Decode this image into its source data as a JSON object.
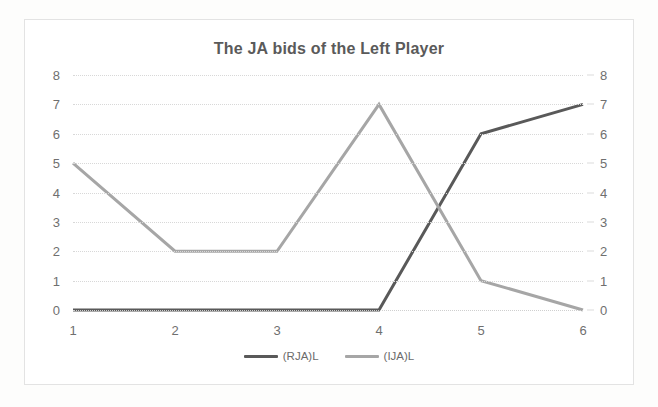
{
  "chart": {
    "title": "The JA bids of the Left Player"
  },
  "axes": {
    "left_ticks": [
      "8",
      "7",
      "6",
      "5",
      "4",
      "3",
      "2",
      "1",
      "0"
    ],
    "right_ticks": [
      "8",
      "7",
      "6",
      "5",
      "4",
      "3",
      "2",
      "1",
      "0"
    ],
    "x_ticks": [
      "1",
      "2",
      "3",
      "4",
      "5",
      "6"
    ]
  },
  "legend": {
    "items": [
      {
        "label": "(RJA)L",
        "color": "#595959"
      },
      {
        "label": "(IJA)L",
        "color": "#a6a6a6"
      }
    ]
  },
  "chart_data": {
    "type": "line",
    "title": "The JA bids of the Left Player",
    "xlabel": "",
    "ylabel": "",
    "categories": [
      "1",
      "2",
      "3",
      "4",
      "5",
      "6"
    ],
    "x": [
      1,
      2,
      3,
      4,
      5,
      6
    ],
    "ylim": [
      0,
      8
    ],
    "y_ticks": [
      0,
      1,
      2,
      3,
      4,
      5,
      6,
      7,
      8
    ],
    "secondary_y_axis": true,
    "secondary_ylim": [
      0,
      8
    ],
    "grid": true,
    "grid_style": "dotted-horizontal",
    "legend_position": "bottom",
    "series": [
      {
        "name": "(RJA)L",
        "color": "#595959",
        "values": [
          0,
          0,
          0,
          0,
          6,
          7
        ]
      },
      {
        "name": "(IJA)L",
        "color": "#a6a6a6",
        "values": [
          5,
          2,
          2,
          7,
          1,
          0
        ]
      }
    ]
  }
}
